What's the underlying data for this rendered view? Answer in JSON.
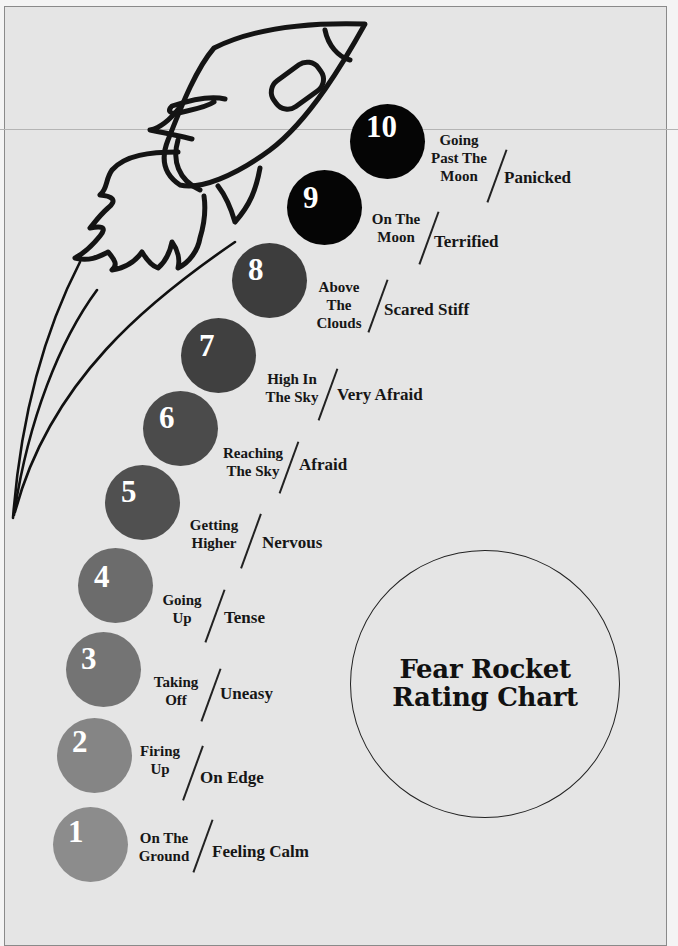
{
  "title": "Fear Rocket\nRating Chart",
  "colors": {
    "background": "#e5e5e5",
    "ink": "#161616",
    "number_text": "#ffffff"
  },
  "rocket": {
    "icon": "rocket-icon",
    "trail_icon": "motion-trail-icon"
  },
  "levels": [
    {
      "number": "1",
      "stage": "On The\nGround",
      "feeling": "Feeling Calm",
      "color": "#8c8c8c"
    },
    {
      "number": "2",
      "stage": "Firing\nUp",
      "feeling": "On Edge",
      "color": "#858585"
    },
    {
      "number": "3",
      "stage": "Taking\nOff",
      "feeling": "Uneasy",
      "color": "#747474"
    },
    {
      "number": "4",
      "stage": "Going\nUp",
      "feeling": "Tense",
      "color": "#6c6c6c"
    },
    {
      "number": "5",
      "stage": "Getting\nHigher",
      "feeling": "Nervous",
      "color": "#505050"
    },
    {
      "number": "6",
      "stage": "Reaching\nThe Sky",
      "feeling": "Afraid",
      "color": "#4b4b4b"
    },
    {
      "number": "7",
      "stage": "High In\nThe Sky",
      "feeling": "Very Afraid",
      "color": "#404040"
    },
    {
      "number": "8",
      "stage": "Above\nThe\nClouds",
      "feeling": "Scared Stiff",
      "color": "#3d3d3d"
    },
    {
      "number": "9",
      "stage": "On The\nMoon",
      "feeling": "Terrified",
      "color": "#050505"
    },
    {
      "number": "10",
      "stage": "Going\nPast The\nMoon",
      "feeling": "Panicked",
      "color": "#050505"
    }
  ]
}
